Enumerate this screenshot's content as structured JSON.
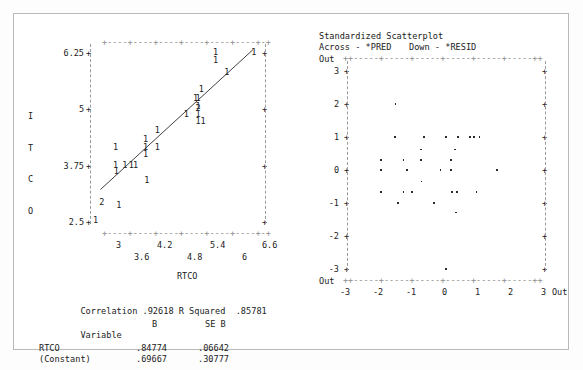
{
  "left_chart": {
    "ylabel": "ITCO",
    "ylabel_chars": [
      "I",
      "T",
      "C",
      "O"
    ],
    "xlabel": "RTCO",
    "yticks": [
      "6.25",
      "5",
      "3.75",
      "2.5"
    ],
    "ytick_values": [
      6.25,
      5,
      3.75,
      2.5
    ],
    "xticks_row1": [
      "3",
      "4.2",
      "5.4",
      "6.6"
    ],
    "xticks_row2": [
      "3.6",
      "4.8",
      "6"
    ],
    "xtick_values": [
      3,
      3.6,
      4.2,
      4.8,
      5.4,
      6,
      6.6
    ],
    "point_glyph": "1",
    "overlap_glyph": "2",
    "axis_rule": "+----+----+----+----+----+----+-+"
  },
  "chart_data": [
    {
      "type": "scatter",
      "title": "",
      "xlabel": "RTCO",
      "ylabel": "ITCO",
      "xlim": [
        2.7,
        6.9
      ],
      "ylim": [
        2.4,
        6.45
      ],
      "grid": false,
      "legend": "none",
      "note": "Counts plotted as digits; 1 = one case, 2 = two overlapping cases. Fitted regression line overlaid.",
      "regression_line": {
        "slope": 0.84774,
        "intercept": 0.69667,
        "x_start": 2.95,
        "x_end": 6.62
      },
      "points": [
        {
          "x": 2.82,
          "y": 2.52,
          "count": 1
        },
        {
          "x": 2.97,
          "y": 2.93,
          "count": 2
        },
        {
          "x": 3.38,
          "y": 2.86,
          "count": 1
        },
        {
          "x": 3.32,
          "y": 3.6,
          "count": 1
        },
        {
          "x": 3.3,
          "y": 3.74,
          "count": 1
        },
        {
          "x": 3.52,
          "y": 3.74,
          "count": 1
        },
        {
          "x": 3.68,
          "y": 3.74,
          "count": 1
        },
        {
          "x": 3.78,
          "y": 3.74,
          "count": 1
        },
        {
          "x": 3.3,
          "y": 4.15,
          "count": 1
        },
        {
          "x": 4.02,
          "y": 3.98,
          "count": 1
        },
        {
          "x": 4.02,
          "y": 4.15,
          "count": 1
        },
        {
          "x": 4.02,
          "y": 4.33,
          "count": 1
        },
        {
          "x": 4.3,
          "y": 4.52,
          "count": 1
        },
        {
          "x": 4.3,
          "y": 4.15,
          "count": 1
        },
        {
          "x": 4.05,
          "y": 3.42,
          "count": 1
        },
        {
          "x": 5.0,
          "y": 4.88,
          "count": 1
        },
        {
          "x": 5.28,
          "y": 4.88,
          "count": 1
        },
        {
          "x": 5.28,
          "y": 5.05,
          "count": 1
        },
        {
          "x": 5.22,
          "y": 5.22,
          "count": 1
        },
        {
          "x": 5.28,
          "y": 5.22,
          "count": 1
        },
        {
          "x": 5.36,
          "y": 5.42,
          "count": 1
        },
        {
          "x": 5.28,
          "y": 4.72,
          "count": 1
        },
        {
          "x": 5.4,
          "y": 4.72,
          "count": 1
        },
        {
          "x": 5.28,
          "y": 5.0,
          "count": 2
        },
        {
          "x": 5.7,
          "y": 6.25,
          "count": 1
        },
        {
          "x": 5.7,
          "y": 6.07,
          "count": 1
        },
        {
          "x": 5.97,
          "y": 5.8,
          "count": 1
        },
        {
          "x": 6.62,
          "y": 6.25,
          "count": 1
        }
      ]
    },
    {
      "type": "scatter",
      "title": "Standardized Scatterplot",
      "subtitle_left": "Across - *PRED",
      "subtitle_right": "Down - *RESID",
      "xlabel": "*PRED",
      "ylabel": "*RESID",
      "xticks": [
        "-3",
        "-2",
        "-1",
        "0",
        "1",
        "2",
        "3"
      ],
      "xtick_values": [
        -3,
        -2,
        -1,
        0,
        1,
        2,
        3
      ],
      "yticks": [
        "3",
        "2",
        "1",
        "0",
        "-1",
        "-2",
        "-3"
      ],
      "ytick_values": [
        3,
        2,
        1,
        0,
        -1,
        -2,
        -3
      ],
      "out_label": "Out",
      "xlim": [
        -3,
        3
      ],
      "ylim": [
        -3,
        3
      ],
      "grid": false,
      "legend": "none",
      "points": [
        {
          "x": -1.6,
          "y": 2.0
        },
        {
          "x": -1.62,
          "y": 1.0
        },
        {
          "x": -0.72,
          "y": 1.0
        },
        {
          "x": -0.05,
          "y": 1.0
        },
        {
          "x": 0.32,
          "y": 1.0
        },
        {
          "x": 0.68,
          "y": 1.0
        },
        {
          "x": 0.8,
          "y": 1.0
        },
        {
          "x": 0.97,
          "y": 1.0
        },
        {
          "x": -0.82,
          "y": 0.62
        },
        {
          "x": 0.22,
          "y": 0.62
        },
        {
          "x": -2.05,
          "y": 0.3
        },
        {
          "x": -1.35,
          "y": 0.3
        },
        {
          "x": -0.82,
          "y": 0.3
        },
        {
          "x": 0.1,
          "y": 0.3
        },
        {
          "x": -2.05,
          "y": 0.0
        },
        {
          "x": -1.25,
          "y": 0.0
        },
        {
          "x": -0.22,
          "y": 0.0
        },
        {
          "x": 0.1,
          "y": 0.0
        },
        {
          "x": 1.5,
          "y": 0.0
        },
        {
          "x": -0.8,
          "y": -0.35
        },
        {
          "x": -2.05,
          "y": -0.68
        },
        {
          "x": -1.35,
          "y": -0.68
        },
        {
          "x": -1.1,
          "y": -0.68
        },
        {
          "x": 0.12,
          "y": -0.68
        },
        {
          "x": 0.28,
          "y": -0.68
        },
        {
          "x": 0.88,
          "y": -0.68
        },
        {
          "x": -1.52,
          "y": -1.0
        },
        {
          "x": -0.42,
          "y": -1.0
        },
        {
          "x": 0.25,
          "y": -1.3
        },
        {
          "x": -0.05,
          "y": -3.0
        }
      ]
    }
  ],
  "stats": {
    "correlation_label": "Correlation",
    "correlation_value": ".92618",
    "rsquared_label": "R Squared",
    "rsquared_value": ".85781",
    "table_headers": [
      "Variable",
      "B",
      "SE B"
    ],
    "rows": [
      {
        "variable": "RTCO",
        "b": ".84774",
        "se_b": ".06642"
      },
      {
        "variable": "(Constant)",
        "b": ".69667",
        "se_b": ".30777"
      }
    ]
  },
  "colors": {
    "ink": "#222222",
    "dash": "#8c8c8c",
    "frame": "#b9b9b9",
    "page": "#ffffff"
  }
}
